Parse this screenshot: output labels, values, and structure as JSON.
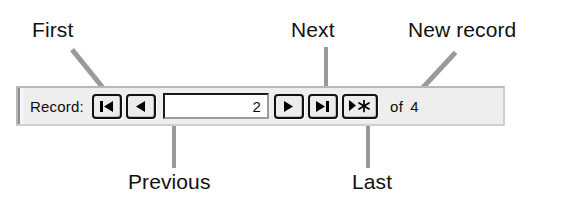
{
  "navbar": {
    "record_label": "Record:",
    "record_number_value": "2",
    "record_number_placeholder": "",
    "of_label": "of",
    "total_records": "4",
    "buttons": [
      {
        "name": "first-record-button",
        "icon": "first-record-icon",
        "glyph": "|◀",
        "title": "First"
      },
      {
        "name": "previous-record-button",
        "icon": "previous-record-icon",
        "glyph": "◀",
        "title": "Previous"
      },
      {
        "name": "next-record-button",
        "icon": "next-record-icon",
        "glyph": "▶",
        "title": "Next"
      },
      {
        "name": "last-record-button",
        "icon": "last-record-icon",
        "glyph": "▶|",
        "title": "Last"
      },
      {
        "name": "new-record-button",
        "icon": "new-record-icon",
        "glyph": "▶✳",
        "title": "New record"
      }
    ]
  },
  "annotations": {
    "first": "First",
    "next": "Next",
    "new_record": "New record",
    "previous": "Previous",
    "last": "Last"
  },
  "colors": {
    "bar_background": "#eeeeee",
    "leader_line": "#9a9a9a",
    "text": "#111111",
    "glyph": "#000000",
    "field_background": "#ffffff"
  }
}
